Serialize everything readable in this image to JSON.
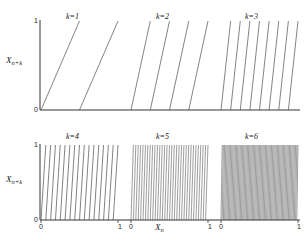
{
  "figure": {
    "title": "",
    "background_color": "#ffffff",
    "line_color": "#4d4d4d",
    "axis_color": "#333333",
    "width": 308,
    "height": 247
  },
  "axes": {
    "x_label": "X",
    "x_label_sub": "n",
    "y_label": "X",
    "y_label_sub": "n+k",
    "x_ticks": [
      "0",
      "1"
    ],
    "y_ticks": [
      "0",
      "1"
    ],
    "xlim": [
      0,
      1
    ],
    "ylim": [
      0,
      1
    ]
  },
  "panels": [
    {
      "id": "k1",
      "label": "k=1",
      "k": 1,
      "branches": 2,
      "row": 0,
      "col": 0
    },
    {
      "id": "k2",
      "label": "k=2",
      "k": 2,
      "branches": 4,
      "row": 0,
      "col": 1
    },
    {
      "id": "k3",
      "label": "k=3",
      "k": 3,
      "branches": 8,
      "row": 0,
      "col": 2
    },
    {
      "id": "k4",
      "label": "k=4",
      "k": 4,
      "branches": 16,
      "row": 1,
      "col": 0
    },
    {
      "id": "k5",
      "label": "k=5",
      "k": 5,
      "branches": 32,
      "row": 1,
      "col": 1
    },
    {
      "id": "k6",
      "label": "k=6",
      "k": 6,
      "branches": 64,
      "row": 1,
      "col": 2
    }
  ],
  "chart_data": {
    "type": "line",
    "title": "",
    "subtitle": "",
    "xlabel": "X_n",
    "ylabel": "X_n+k",
    "xlim": [
      0,
      1
    ],
    "ylim": [
      0,
      1
    ],
    "grid": false,
    "legend": "none",
    "panel_layout": {
      "rows": 2,
      "cols": 3
    },
    "series": [
      {
        "name": "k=1",
        "k": 1,
        "branches": 2,
        "slope": 2,
        "segments_x_breaks": [
          0,
          0.5,
          1
        ]
      },
      {
        "name": "k=2",
        "k": 2,
        "branches": 4,
        "slope": 4,
        "segments_x_breaks": [
          0,
          0.25,
          0.5,
          0.75,
          1
        ]
      },
      {
        "name": "k=3",
        "k": 3,
        "branches": 8,
        "slope": 8,
        "segments_x_breaks": [
          0,
          0.125,
          0.25,
          0.375,
          0.5,
          0.625,
          0.75,
          0.875,
          1
        ]
      },
      {
        "name": "k=4",
        "k": 4,
        "branches": 16,
        "slope": 16,
        "segments_x_breaks": [
          0,
          0.0625,
          0.125,
          0.1875,
          0.25,
          0.3125,
          0.375,
          0.4375,
          0.5,
          0.5625,
          0.625,
          0.6875,
          0.75,
          0.8125,
          0.875,
          0.9375,
          1
        ]
      },
      {
        "name": "k=5",
        "k": 5,
        "branches": 32,
        "slope": 32,
        "segments_x_breaks": "i/32 for i in 0..32"
      },
      {
        "name": "k=6",
        "k": 6,
        "branches": 64,
        "slope": 64,
        "segments_x_breaks": "i/64 for i in 0..64"
      }
    ],
    "axis_tick_labels": {
      "x_top_row": [],
      "x_bottom_row": [
        "0",
        "1",
        "0",
        "1",
        "0",
        "1"
      ],
      "y_rows": [
        "0",
        "1"
      ]
    }
  }
}
